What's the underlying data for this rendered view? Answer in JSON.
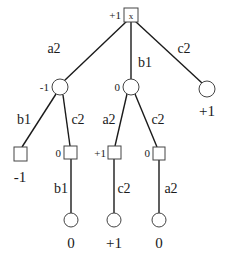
{
  "diagram": {
    "type": "game-tree",
    "root": {
      "shape": "square-x",
      "value": "+1"
    },
    "edges": {
      "root_a2": "a2",
      "root_b1": "b1",
      "root_c2": "c2",
      "left_b1": "b1",
      "left_c2": "c2",
      "mid_a2": "a2",
      "mid_c2": "c2",
      "sq2_b1": "b1",
      "sq3_c2": "c2",
      "sq4_a2": "a2"
    },
    "nodes": {
      "left_circle": {
        "shape": "circle",
        "value": "-1"
      },
      "mid_circle": {
        "shape": "circle",
        "value": "0"
      },
      "right_circle": {
        "shape": "circle",
        "value": "+1"
      },
      "sq1": {
        "shape": "square",
        "value": "-1"
      },
      "sq2": {
        "shape": "square",
        "value": "0"
      },
      "sq3": {
        "shape": "square",
        "value": "+1"
      },
      "sq4": {
        "shape": "square",
        "value": "0"
      },
      "leaf1": {
        "shape": "circle",
        "value": "0"
      },
      "leaf2": {
        "shape": "circle",
        "value": "+1"
      },
      "leaf3": {
        "shape": "circle",
        "value": "0"
      }
    }
  }
}
